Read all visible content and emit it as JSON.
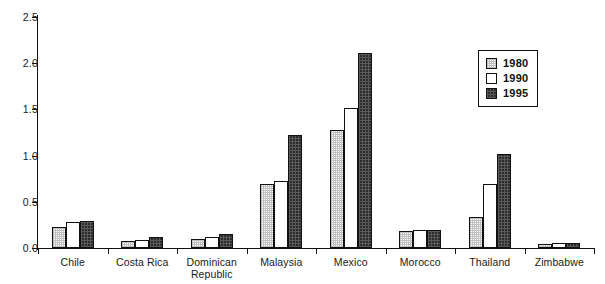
{
  "chart_data": {
    "type": "bar",
    "title": "",
    "xlabel": "",
    "ylabel": "",
    "ylim": [
      0.0,
      2.5
    ],
    "grid": false,
    "legend_position": "top-right",
    "ytick_labels": [
      "0.0",
      "0.5",
      "1.0",
      "1.5",
      "2.0",
      "2.5"
    ],
    "ytick_values": [
      0.0,
      0.5,
      1.0,
      1.5,
      2.0,
      2.5
    ],
    "categories": [
      "Chile",
      "Costa Rica",
      "Dominican Republic",
      "Malaysia",
      "Mexico",
      "Morocco",
      "Thailand",
      "Zimbabwe"
    ],
    "category_lines": [
      [
        "Chile"
      ],
      [
        "Costa Rica"
      ],
      [
        "Dominican",
        "Republic"
      ],
      [
        "Malaysia"
      ],
      [
        "Mexico"
      ],
      [
        "Morocco"
      ],
      [
        "Thailand"
      ],
      [
        "Zimbabwe"
      ]
    ],
    "series": [
      {
        "name": "1980",
        "values": [
          0.23,
          0.08,
          0.1,
          0.69,
          1.28,
          0.18,
          0.34,
          0.04
        ]
      },
      {
        "name": "1990",
        "values": [
          0.28,
          0.09,
          0.12,
          0.72,
          1.52,
          0.2,
          0.69,
          0.05
        ]
      },
      {
        "name": "1995",
        "values": [
          0.29,
          0.12,
          0.15,
          1.22,
          2.11,
          0.2,
          1.02,
          0.05
        ]
      }
    ]
  },
  "legend": {
    "items": [
      {
        "label": "1980",
        "swatch": "light-stipple-swatch"
      },
      {
        "label": "1990",
        "swatch": "white-swatch"
      },
      {
        "label": "1995",
        "swatch": "dark-stipple-swatch"
      }
    ]
  }
}
